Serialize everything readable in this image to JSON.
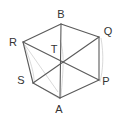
{
  "diagram": {
    "type": "hexagon-with-diagonals",
    "vertices": [
      {
        "id": "B",
        "label": "B"
      },
      {
        "id": "Q",
        "label": "Q"
      },
      {
        "id": "P",
        "label": "P"
      },
      {
        "id": "A",
        "label": "A"
      },
      {
        "id": "S",
        "label": "S"
      },
      {
        "id": "R",
        "label": "R"
      },
      {
        "id": "T",
        "label": "T"
      }
    ],
    "edges": [
      [
        "B",
        "Q"
      ],
      [
        "Q",
        "P"
      ],
      [
        "P",
        "A"
      ],
      [
        "A",
        "S"
      ],
      [
        "S",
        "R"
      ],
      [
        "R",
        "B"
      ],
      [
        "B",
        "A"
      ],
      [
        "R",
        "P"
      ],
      [
        "Q",
        "S"
      ]
    ],
    "colors": {
      "line": "#5a5a5a",
      "sketch": "#c8c8c8",
      "label": "#333333"
    }
  }
}
